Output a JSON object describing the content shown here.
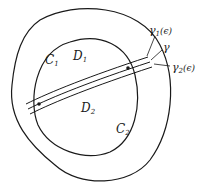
{
  "diagram": {
    "labels": {
      "C1": {
        "main": "C",
        "sub": "1"
      },
      "D1": {
        "main": "D",
        "sub": "1"
      },
      "D2": {
        "main": "D",
        "sub": "2"
      },
      "C2": {
        "main": "C",
        "sub": "2"
      },
      "gamma1": {
        "main": "γ",
        "sub": "1",
        "suffix": "(ϵ)"
      },
      "gamma": {
        "main": "γ"
      },
      "gamma2": {
        "main": "γ",
        "sub": "2",
        "suffix": "(ϵ)"
      }
    },
    "colors": {
      "stroke": "#1a1a1a",
      "background": "#ffffff"
    }
  }
}
